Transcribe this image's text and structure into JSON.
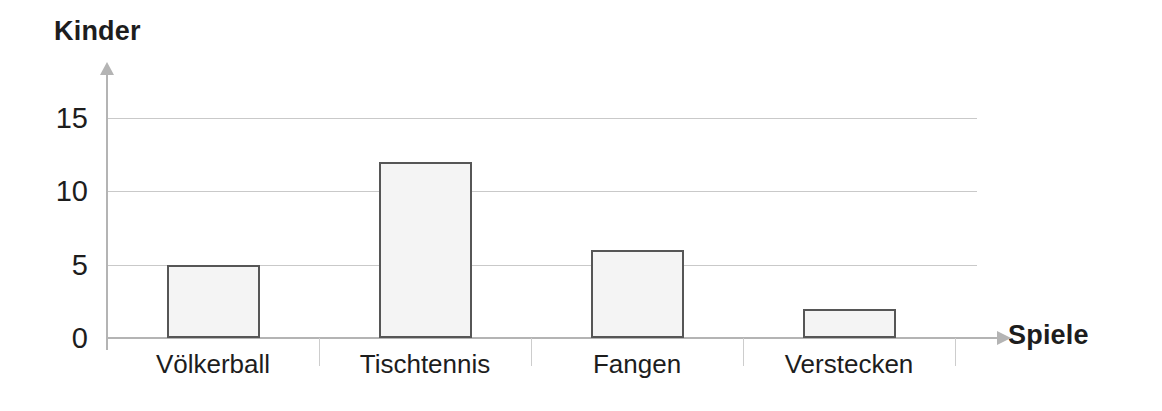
{
  "chart_data": {
    "type": "bar",
    "title": "",
    "xlabel": "Spiele",
    "ylabel": "Kinder",
    "categories": [
      "Völkerball",
      "Tischtennis",
      "Fangen",
      "Verstecken"
    ],
    "values": [
      5,
      12,
      6,
      2
    ],
    "yticks": [
      0,
      5,
      10,
      15
    ],
    "ytick_labels": [
      "0",
      "5",
      "10",
      "15"
    ],
    "ylim": [
      0,
      15.6
    ],
    "grid": true,
    "legend": null,
    "series": [
      {
        "name": "Kinder",
        "values": [
          5,
          12,
          6,
          2
        ]
      }
    ]
  },
  "style": {
    "bar_fill": "#f4f4f4",
    "bar_border": "#565656",
    "gridline_color": "#c9c9c9",
    "axis_color": "#b4b4b4",
    "text_color": "#1d1d1d",
    "background": "#ffffff"
  }
}
